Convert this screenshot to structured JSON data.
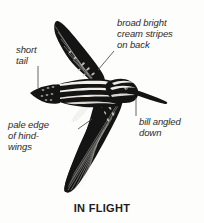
{
  "figure": {
    "caption": "IN FLIGHT",
    "background_color": "#fdfdfc",
    "ink_color": "#141414",
    "leader_color": "#555555",
    "text_color": "#2b2b2b"
  },
  "annotations": [
    {
      "id": "short-tail",
      "text": "short\ntail",
      "points_to": "tail",
      "leader": "vertical"
    },
    {
      "id": "back-stripes",
      "text": "broad bright\ncream stripes\non back",
      "points_to": "back",
      "leader": "diagonal"
    },
    {
      "id": "pale-edge",
      "text": "pale edge\nof hind-\nwings",
      "points_to": "hindwing-trailing-edge",
      "leader": "diagonal"
    },
    {
      "id": "bill",
      "text": "bill angled\ndown",
      "points_to": "bill-tip",
      "leader": "vertical"
    }
  ]
}
